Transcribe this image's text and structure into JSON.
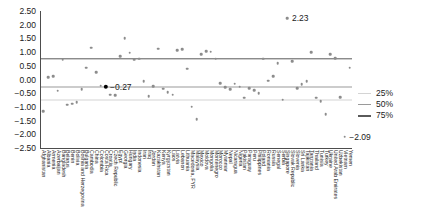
{
  "chart_data": {
    "type": "scatter",
    "title": "",
    "xlabel": "",
    "ylabel": "",
    "ylim": [
      -2.5,
      2.5
    ],
    "grid": false,
    "legend_position": "right",
    "yticks": [
      "2.50",
      "2.00",
      "1.50",
      "1.00",
      "0.50",
      "0.00",
      "−0.50",
      "−1.00",
      "−1.50",
      "−2.00",
      "−2.50"
    ],
    "ytick_values": [
      2.5,
      2.0,
      1.5,
      1.0,
      0.5,
      0.0,
      -0.5,
      -1.0,
      -1.5,
      -2.0,
      -2.5
    ],
    "reflines": [
      {
        "label": "25%",
        "value": -0.75,
        "color": "#d4d4d4"
      },
      {
        "label": "50%",
        "value": -0.27,
        "color": "#9a9a9a"
      },
      {
        "label": "75%",
        "value": 0.75,
        "color": "#5a5a5a"
      }
    ],
    "legend": [
      {
        "label": "25%",
        "color": "#d4d4d4"
      },
      {
        "label": "50%",
        "color": "#9a9a9a"
      },
      {
        "label": "75%",
        "color": "#5a5a5a"
      }
    ],
    "annotations": [
      {
        "text": "2.23",
        "value": 2.23,
        "category": "Singapore"
      },
      {
        "text": "−0.27",
        "value": -0.27,
        "category": "Costa Rica"
      },
      {
        "text": "−2.09",
        "value": -2.09,
        "category": "Vietnam"
      }
    ],
    "point_color": "#8c8c8c",
    "highlight_color": "#000000",
    "categories": [
      "Afghanistan",
      "Albania",
      "Armenia",
      "Azerbaijan",
      "Bangladesh",
      "Belarus",
      "Benin",
      "Bolivia",
      "Bosnia and Herzegovina",
      "Bulgaria",
      "Cambodia",
      "China",
      "Colombia",
      "Costa Rica",
      "Croatia",
      "Czech Republic",
      "Egypt",
      "Georgia",
      "Hungary",
      "India",
      "Indonesia",
      "Iran",
      "Iraq",
      "Jordan",
      "Kazakhstan",
      "Kenya",
      "Kyrgyzstan",
      "Laos",
      "Latvia",
      "Lebanon",
      "Lithuania",
      "Macedonia, FYR",
      "Malaysia",
      "Mexico",
      "Moldova",
      "Mongolia",
      "Montenegro",
      "Morocco",
      "Myanmar",
      "Nepal",
      "Nicaragua",
      "Nigeria",
      "Pakistan",
      "Paraguay",
      "Peru",
      "Philippines",
      "Poland",
      "Romania",
      "Russia",
      "Senegal",
      "Serbia",
      "Singapore",
      "Slovak Republic",
      "Slovenia",
      "Sri Lanka",
      "Tajikistan",
      "Tanzania",
      "Thailand",
      "Tunisia",
      "Turkey",
      "Ukraine",
      "United Arab Emirates",
      "Uzbekistan",
      "Vietnam",
      "Yemen"
    ],
    "values": [
      -1.16,
      0.08,
      0.12,
      -0.41,
      0.72,
      -0.92,
      -0.88,
      -0.83,
      -0.35,
      0.43,
      1.16,
      0.27,
      -0.23,
      -0.27,
      -0.55,
      -0.57,
      0.86,
      1.51,
      0.98,
      0.72,
      0.76,
      -0.06,
      -0.61,
      -0.24,
      1.12,
      -0.34,
      -0.47,
      -0.55,
      1.08,
      1.1,
      0.4,
      -1.0,
      -1.44,
      0.93,
      1.03,
      1.01,
      0.76,
      -0.13,
      -0.29,
      -0.36,
      -0.16,
      -0.27,
      -0.66,
      -0.32,
      -0.38,
      -0.51,
      0.76,
      -0.05,
      0.11,
      0.6,
      -0.73,
      2.23,
      0.67,
      -0.31,
      -0.17,
      -0.07,
      0.99,
      -0.66,
      -0.79,
      -1.26,
      0.92,
      0.78,
      -0.65,
      -2.09,
      0.43
    ]
  }
}
